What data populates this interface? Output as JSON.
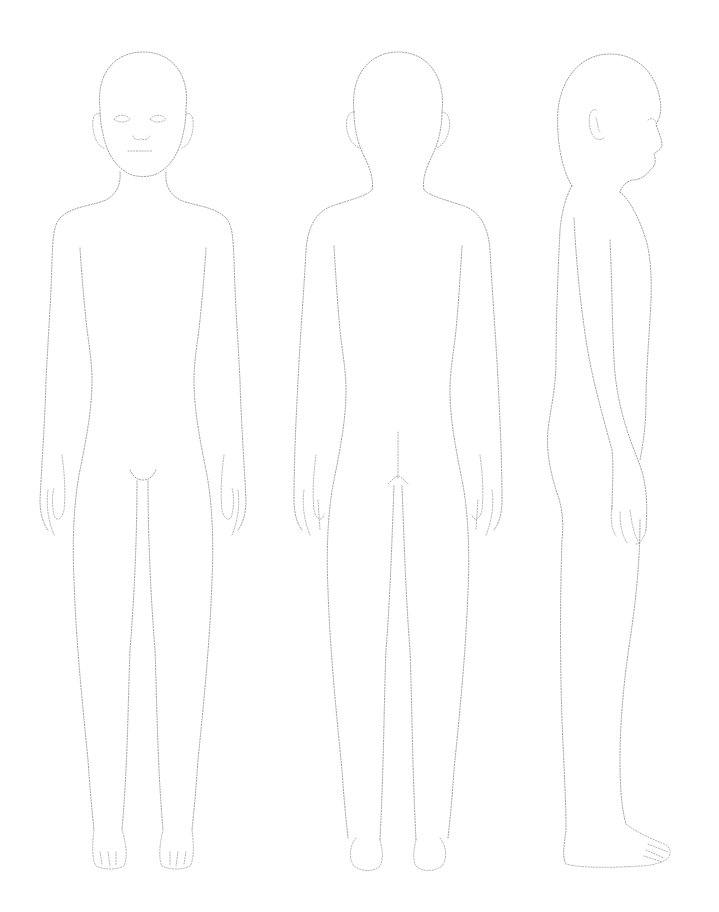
{
  "figure": {
    "type": "croquis-template",
    "views": [
      {
        "name": "front",
        "label": ""
      },
      {
        "name": "back",
        "label": ""
      },
      {
        "name": "side",
        "label": ""
      }
    ],
    "line_color": "#9a9a9a",
    "background": "#ffffff",
    "line_style": "dotted"
  }
}
